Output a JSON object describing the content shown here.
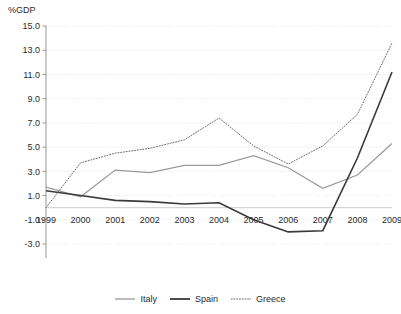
{
  "chart_data": {
    "type": "line",
    "title": "",
    "subtitle": "",
    "xlabel": "",
    "ylabel": "%GDP",
    "unit_label": "%GDP",
    "grid": true,
    "legend_position": "bottom",
    "x": [
      1999,
      2000,
      2001,
      2002,
      2003,
      2004,
      2005,
      2006,
      2007,
      2008,
      2009
    ],
    "categories": [
      "1999",
      "2000",
      "2001",
      "2002",
      "2003",
      "2004",
      "2005",
      "2006",
      "2007",
      "2008",
      "2009"
    ],
    "xlim": [
      1999,
      2009
    ],
    "ylim": [
      -3.0,
      15.0
    ],
    "yticks": [
      -3.0,
      -1.0,
      1.0,
      3.0,
      5.0,
      7.0,
      9.0,
      11.0,
      13.0,
      15.0
    ],
    "ytick_labels": [
      "-3.0",
      "-1.0",
      "1.0",
      "3.0",
      "5.0",
      "7.0",
      "9.0",
      "11.0",
      "13.0",
      "15.0"
    ],
    "series": [
      {
        "name": "Italy",
        "color": "#9a9a9a",
        "style": "solid",
        "values": [
          1.7,
          0.9,
          3.1,
          2.9,
          3.5,
          3.5,
          4.3,
          3.3,
          1.6,
          2.7,
          5.3
        ]
      },
      {
        "name": "Spain",
        "color": "#3a3a3a",
        "style": "solid",
        "values": [
          1.4,
          1.0,
          0.6,
          0.5,
          0.3,
          0.4,
          -1.0,
          -2.0,
          -1.9,
          4.1,
          11.2
        ]
      },
      {
        "name": "Greece",
        "color": "#6f6f6f",
        "style": "dotted",
        "values": [
          0.0,
          3.7,
          4.5,
          4.9,
          5.6,
          7.4,
          5.1,
          3.6,
          5.1,
          7.7,
          13.6
        ]
      }
    ]
  },
  "legend": {
    "items": [
      {
        "label": "Italy",
        "color": "#9a9a9a",
        "style": "solid"
      },
      {
        "label": "Spain",
        "color": "#3a3a3a",
        "style": "solid"
      },
      {
        "label": "Greece",
        "color": "#6f6f6f",
        "style": "dotted"
      }
    ]
  },
  "colors": {
    "italy": "#9a9a9a",
    "spain": "#3a3a3a",
    "greece": "#6f6f6f",
    "grid": "#d8d8e4",
    "axis": "#8c8c8c",
    "text": "#2b2b2b",
    "background": "#ffffff"
  }
}
